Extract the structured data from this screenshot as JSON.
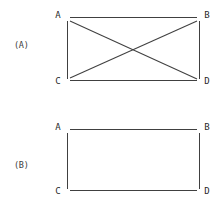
{
  "figure": {
    "background_color": "#ffffff",
    "line_color": "#404040",
    "label_color": "#2a2a2a",
    "width": 218,
    "height": 204,
    "panels": [
      {
        "caption": "(A)",
        "caption_x": 14,
        "caption_y": 48,
        "vertices": [
          {
            "name": "A",
            "label": "A",
            "x": 67,
            "y": 18,
            "label_x": 60,
            "label_y": 18
          },
          {
            "name": "B",
            "label": "B",
            "x": 199,
            "y": 18,
            "label_x": 202,
            "label_y": 18
          },
          {
            "name": "C",
            "label": "C",
            "x": 67,
            "y": 80,
            "label_x": 60,
            "label_y": 83
          },
          {
            "name": "D",
            "label": "D",
            "x": 199,
            "y": 80,
            "label_x": 202,
            "label_y": 83
          }
        ],
        "edges": [
          {
            "name": "edge-a-b",
            "from": "A",
            "to": "B"
          },
          {
            "name": "edge-a-c",
            "from": "A",
            "to": "C"
          },
          {
            "name": "edge-b-d",
            "from": "B",
            "to": "D"
          },
          {
            "name": "edge-c-d",
            "from": "C",
            "to": "D"
          },
          {
            "name": "edge-a-d",
            "from": "A",
            "to": "D"
          },
          {
            "name": "edge-c-b",
            "from": "C",
            "to": "B"
          }
        ],
        "edge_count": 6,
        "has_diagonals": true
      },
      {
        "caption": "(B)",
        "caption_x": 14,
        "caption_y": 168,
        "vertices": [
          {
            "name": "A",
            "label": "A",
            "x": 67,
            "y": 130,
            "label_x": 60,
            "label_y": 130
          },
          {
            "name": "B",
            "label": "B",
            "x": 199,
            "y": 130,
            "label_x": 202,
            "label_y": 130
          },
          {
            "name": "C",
            "label": "C",
            "x": 67,
            "y": 190,
            "label_x": 60,
            "label_y": 193
          },
          {
            "name": "D",
            "label": "D",
            "x": 199,
            "y": 190,
            "label_x": 202,
            "label_y": 193
          }
        ],
        "edges": [
          {
            "name": "edge-a-b",
            "from": "A",
            "to": "B"
          },
          {
            "name": "edge-a-c",
            "from": "A",
            "to": "C"
          },
          {
            "name": "edge-b-d",
            "from": "B",
            "to": "D"
          },
          {
            "name": "edge-c-d",
            "from": "C",
            "to": "D"
          }
        ],
        "edge_count": 4,
        "has_diagonals": false
      }
    ]
  }
}
